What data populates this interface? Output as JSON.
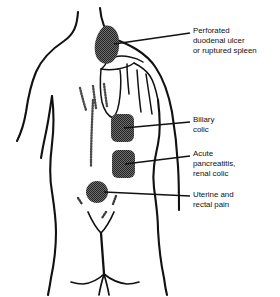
{
  "figure": {
    "view": "posterior",
    "background_color": "#ffffff",
    "ink_color": "#111111",
    "patch_color": "#5a5a5a"
  },
  "labels": [
    {
      "id": "perforated-duodenal-ulcer",
      "lines": [
        "Perforated",
        "duodenal ulcer",
        "or ruptured spleen"
      ],
      "site": "left shoulder / subscapular region"
    },
    {
      "id": "biliary-colic",
      "lines": [
        "Biliary",
        "colic"
      ],
      "site": "right inferior scapular region"
    },
    {
      "id": "acute-pancreatitis-renal-colic",
      "lines": [
        "Acute",
        "pancreatitis,",
        "renal colic"
      ],
      "site": "mid/lower thoracolumbar region"
    },
    {
      "id": "uterine-rectal-pain",
      "lines": [
        "Uterine and",
        "rectal pain"
      ],
      "site": "sacral region"
    }
  ],
  "pain_patches": [
    {
      "id": "patch-shoulder",
      "shape": "blob",
      "label_ref": "perforated-duodenal-ulcer"
    },
    {
      "id": "patch-upper-back",
      "shape": "rounded-rect",
      "label_ref": "biliary-colic"
    },
    {
      "id": "patch-lower-back",
      "shape": "rounded-rect",
      "label_ref": "acute-pancreatitis-renal-colic"
    },
    {
      "id": "patch-sacrum",
      "shape": "circle",
      "label_ref": "uterine-rectal-pain"
    }
  ],
  "anatomy": {
    "parts": [
      "neck",
      "shoulders",
      "arms",
      "torso",
      "waist",
      "buttocks",
      "scapula",
      "clavicle",
      "ribs",
      "vertebral column",
      "gluteal cleft"
    ]
  }
}
